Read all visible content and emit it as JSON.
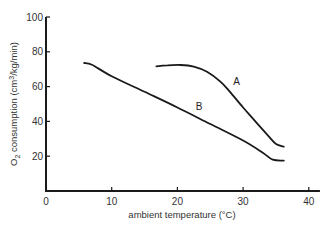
{
  "chart_data": {
    "type": "line",
    "title": "",
    "xlabel": "ambient temperature (°C)",
    "ylabel": "O₂ consumption (cm³/kg/min)",
    "xlim": [
      0,
      42
    ],
    "ylim": [
      0,
      100
    ],
    "xticks": [
      0,
      10,
      20,
      30,
      40
    ],
    "yticks": [
      20,
      40,
      60,
      80,
      100
    ],
    "xtick_labels": [
      "0",
      "10",
      "20",
      "30",
      "40"
    ],
    "ytick_labels": [
      "20",
      "40",
      "60",
      "80",
      "100"
    ],
    "grid": false,
    "legend": "inline labels",
    "series": [
      {
        "name": "A",
        "label_position": {
          "x": 28.5,
          "y": 61
        },
        "points": [
          {
            "x": 16.8,
            "y": 71.6
          },
          {
            "x": 18.5,
            "y": 72.2
          },
          {
            "x": 20.5,
            "y": 72.4
          },
          {
            "x": 22.5,
            "y": 71.5
          },
          {
            "x": 24.5,
            "y": 68.5
          },
          {
            "x": 26.5,
            "y": 63.0
          },
          {
            "x": 28.0,
            "y": 57.0
          },
          {
            "x": 30.0,
            "y": 48.0
          },
          {
            "x": 32.0,
            "y": 39.5
          },
          {
            "x": 34.0,
            "y": 31.0
          },
          {
            "x": 35.0,
            "y": 27.0
          },
          {
            "x": 36.2,
            "y": 25.5
          }
        ]
      },
      {
        "name": "B",
        "label_position": {
          "x": 22.8,
          "y": 46.5
        },
        "points": [
          {
            "x": 5.8,
            "y": 73.6
          },
          {
            "x": 7.0,
            "y": 72.5
          },
          {
            "x": 10.0,
            "y": 66.0
          },
          {
            "x": 15.0,
            "y": 57.0
          },
          {
            "x": 20.0,
            "y": 48.0
          },
          {
            "x": 25.0,
            "y": 38.5
          },
          {
            "x": 30.0,
            "y": 29.0
          },
          {
            "x": 33.0,
            "y": 22.0
          },
          {
            "x": 34.5,
            "y": 18.0
          },
          {
            "x": 36.2,
            "y": 17.5
          }
        ]
      }
    ]
  },
  "labels": {
    "xlabel": "ambient temperature (°C)",
    "ylabel_prefix": "O",
    "ylabel_sub": "2",
    "ylabel_rest": " consumption (cm",
    "ylabel_sup": "3",
    "ylabel_end": "/kg/min)"
  }
}
